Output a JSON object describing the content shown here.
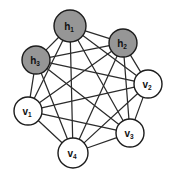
{
  "figure": {
    "background_color": "#ffffff",
    "width": 174,
    "height": 177
  },
  "style": {
    "hidden_fill": "#969696",
    "visible_fill": "#ffffff",
    "node_stroke": "#1c1c1c",
    "edge_color": "#2b2b2b",
    "edge_width": 1.25
  },
  "chart_data": {
    "type": "diagram",
    "graph_type": "complete-graph",
    "node_count": 7,
    "edge_count": 21,
    "nodes": [
      {
        "id": "h1",
        "label": "h",
        "subscript": "1",
        "group": "hidden",
        "fill": "#969696",
        "cx": 70,
        "cy": 26,
        "r": 16
      },
      {
        "id": "h2",
        "label": "h",
        "subscript": "2",
        "group": "hidden",
        "fill": "#969696",
        "cx": 123,
        "cy": 43,
        "r": 14
      },
      {
        "id": "h3",
        "label": "h",
        "subscript": "3",
        "group": "hidden",
        "fill": "#969696",
        "cx": 36,
        "cy": 60,
        "r": 14
      },
      {
        "id": "v1",
        "label": "v",
        "subscript": "1",
        "group": "visible",
        "fill": "#ffffff",
        "cx": 28,
        "cy": 111,
        "r": 14
      },
      {
        "id": "v2",
        "label": "v",
        "subscript": "2",
        "group": "visible",
        "fill": "#ffffff",
        "cx": 148,
        "cy": 84,
        "r": 14
      },
      {
        "id": "v3",
        "label": "v",
        "subscript": "3",
        "group": "visible",
        "fill": "#ffffff",
        "cx": 130,
        "cy": 133,
        "r": 14
      },
      {
        "id": "v4",
        "label": "v",
        "subscript": "4",
        "group": "visible",
        "fill": "#ffffff",
        "cx": 73,
        "cy": 153,
        "r": 15
      }
    ],
    "edges": [
      [
        "h1",
        "h2"
      ],
      [
        "h1",
        "h3"
      ],
      [
        "h1",
        "v1"
      ],
      [
        "h1",
        "v2"
      ],
      [
        "h1",
        "v3"
      ],
      [
        "h1",
        "v4"
      ],
      [
        "h2",
        "h3"
      ],
      [
        "h2",
        "v1"
      ],
      [
        "h2",
        "v2"
      ],
      [
        "h2",
        "v3"
      ],
      [
        "h2",
        "v4"
      ],
      [
        "h3",
        "v1"
      ],
      [
        "h3",
        "v2"
      ],
      [
        "h3",
        "v3"
      ],
      [
        "h3",
        "v4"
      ],
      [
        "v1",
        "v2"
      ],
      [
        "v1",
        "v3"
      ],
      [
        "v1",
        "v4"
      ],
      [
        "v2",
        "v3"
      ],
      [
        "v2",
        "v4"
      ],
      [
        "v3",
        "v4"
      ]
    ],
    "legend": [
      {
        "group": "hidden",
        "label": "hidden units",
        "fill": "#969696"
      },
      {
        "group": "visible",
        "label": "visible units",
        "fill": "#ffffff"
      }
    ]
  }
}
